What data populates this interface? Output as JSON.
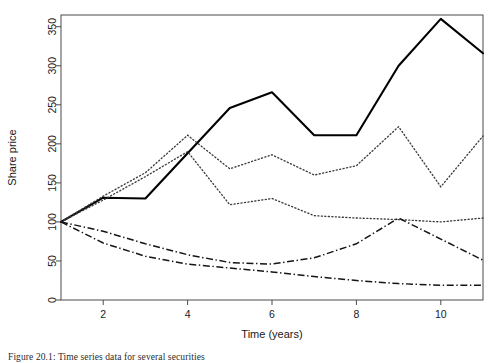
{
  "figure": {
    "caption": "Figure 20.1: Time series data for several securities"
  },
  "chart_data": {
    "type": "line",
    "title": "",
    "xlabel": "Time (years)",
    "ylabel": "Share price",
    "x": [
      1,
      2,
      3,
      4,
      5,
      6,
      7,
      8,
      9,
      10,
      11
    ],
    "xlim": [
      1,
      11
    ],
    "ylim": [
      0,
      365
    ],
    "xticks": [
      2,
      4,
      6,
      8,
      10
    ],
    "xtick_labels": [
      "2",
      "4",
      "6",
      "8",
      "10"
    ],
    "yticks": [
      0,
      50,
      100,
      150,
      200,
      250,
      300,
      350
    ],
    "ytick_labels": [
      "0",
      "50",
      "100",
      "150",
      "200",
      "250",
      "300",
      "350"
    ],
    "grid": false,
    "legend": "none",
    "series": [
      {
        "name": "series-1",
        "style": "solid",
        "values": [
          100,
          131,
          130,
          188,
          246,
          266,
          211,
          211,
          300,
          360,
          316
        ]
      },
      {
        "name": "series-2",
        "style": "dotted",
        "values": [
          100,
          133,
          163,
          211,
          168,
          186,
          160,
          172,
          222,
          145,
          210
        ]
      },
      {
        "name": "series-3",
        "style": "dotted",
        "values": [
          100,
          128,
          158,
          190,
          122,
          130,
          108,
          105,
          103,
          100,
          105
        ]
      },
      {
        "name": "series-4",
        "style": "dashdot",
        "values": [
          100,
          88,
          72,
          58,
          48,
          46,
          54,
          72,
          105,
          78,
          51
        ]
      },
      {
        "name": "series-5",
        "style": "dashdot",
        "values": [
          100,
          73,
          56,
          46,
          41,
          36,
          30,
          25,
          21,
          19,
          19
        ]
      }
    ]
  }
}
